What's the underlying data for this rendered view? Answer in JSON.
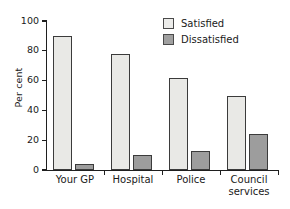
{
  "chart_data": {
    "type": "bar",
    "title": "",
    "xlabel": "",
    "ylabel": "Per cent",
    "ylim": [
      0,
      100
    ],
    "yticks": [
      0,
      20,
      40,
      60,
      80,
      100
    ],
    "grid": false,
    "legend_position": "top-right",
    "categories": [
      "Your GP",
      "Hospital",
      "Police",
      "Council\nservices"
    ],
    "series": [
      {
        "name": "Satisfied",
        "color": "#e9e9e6",
        "values": [
          90,
          78,
          62,
          50
        ]
      },
      {
        "name": "Dissatisfied",
        "color": "#9d9d9d",
        "values": [
          4,
          10,
          13,
          24
        ]
      }
    ]
  },
  "legend": {
    "items": [
      {
        "label": "Satisfied",
        "color": "#e9e9e6"
      },
      {
        "label": "Dissatisfied",
        "color": "#a0a0a0"
      }
    ]
  },
  "axes": {
    "y_label": "Per cent",
    "y_tick_labels": [
      "0",
      "20",
      "40",
      "60",
      "80",
      "100"
    ],
    "x_tick_labels": [
      "Your GP",
      "Hospital",
      "Police",
      "Council\nservices"
    ]
  },
  "colors": {
    "satisfied": "#e9e9e6",
    "dissatisfied": "#9d9d9d",
    "axis": "#1f1f1f",
    "bar_outline": "#3b3b3b",
    "text": "#1a1a1a",
    "background": "#ffffff"
  }
}
